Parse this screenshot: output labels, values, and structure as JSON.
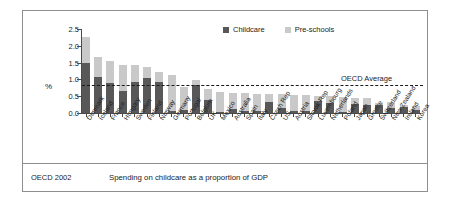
{
  "figure": {
    "source_label": "OECD 2002",
    "caption": "Spending on childcare as a proportion of GDP",
    "axis_label_y": "%",
    "average_label": "OECD Average"
  },
  "legend": {
    "items": [
      {
        "label": "Childcare",
        "color": "#585858"
      },
      {
        "label": "Pre-schools",
        "color": "#c9c9c9"
      }
    ]
  },
  "chart_data": {
    "type": "bar",
    "stacked": true,
    "title": "Spending on childcare as a proportion of GDP",
    "subtitle": "OECD 2002",
    "xlabel": "",
    "ylabel": "%",
    "ylim": [
      0.0,
      2.5
    ],
    "yticks": [
      "0.0",
      "0.5",
      "1.0",
      "1.5",
      "2.0",
      "2.5"
    ],
    "ytick_values": [
      0.0,
      0.5,
      1.0,
      1.5,
      2.0,
      2.5
    ],
    "grid": false,
    "legend_position": "top-right",
    "annotations": [
      {
        "text": "OECD Average",
        "type": "hline",
        "value": 0.8
      }
    ],
    "categories": [
      "Denmark",
      "Iceland",
      "France",
      "Hungary",
      "Sweden",
      "Finland",
      "Norway",
      "Germany",
      "Portugal",
      "Belgium",
      "UK",
      "Mexico",
      "Australia",
      "Spain",
      "Italy",
      "Czech Rep",
      "US",
      "Austria",
      "Slovak Rep",
      "Luxembourg",
      "Netherlands",
      "Poland",
      "Japan",
      "Greece",
      "Switzerland",
      "New Zealand",
      "Ireland",
      "Korea"
    ],
    "series": [
      {
        "name": "Childcare",
        "color": "#585858",
        "values": [
          1.5,
          1.08,
          0.88,
          0.65,
          0.92,
          1.03,
          0.93,
          0.05,
          0.08,
          0.82,
          0.38,
          0.04,
          0.12,
          0.07,
          0.06,
          0.33,
          0.16,
          0.06,
          0.06,
          0.35,
          0.3,
          0.04,
          0.26,
          0.24,
          0.25,
          0.15,
          0.18,
          0.08
        ]
      },
      {
        "name": "Pre-schools",
        "color": "#c9c9c9",
        "values": [
          0.75,
          0.6,
          0.67,
          0.77,
          0.5,
          0.35,
          0.29,
          1.08,
          0.7,
          0.16,
          0.32,
          0.58,
          0.48,
          0.53,
          0.52,
          0.24,
          0.4,
          0.49,
          0.48,
          0.17,
          0.2,
          0.44,
          0.2,
          0.2,
          0.06,
          0.17,
          0.06,
          0.13
        ]
      }
    ],
    "totals": [
      2.25,
      1.68,
      1.55,
      1.42,
      1.42,
      1.38,
      1.22,
      1.13,
      0.78,
      0.98,
      0.7,
      0.62,
      0.6,
      0.6,
      0.58,
      0.57,
      0.56,
      0.55,
      0.54,
      0.52,
      0.5,
      0.48,
      0.46,
      0.44,
      0.31,
      0.32,
      0.24,
      0.21
    ]
  }
}
